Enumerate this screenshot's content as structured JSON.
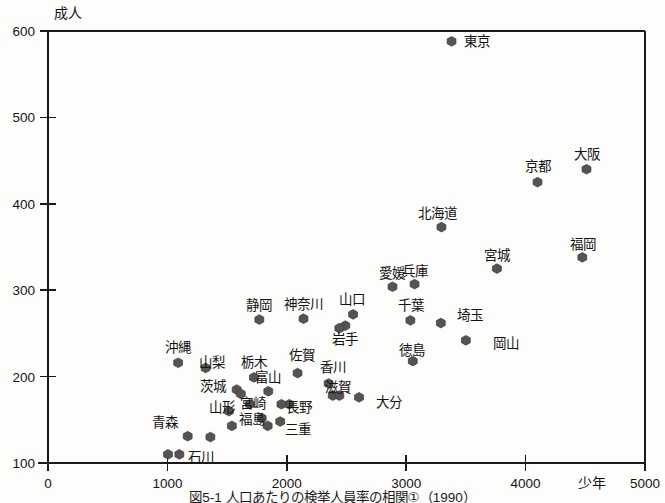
{
  "chart_data": {
    "type": "scatter",
    "title": "",
    "xlabel": "少年",
    "ylabel": "成人",
    "xlim": [
      0,
      5000
    ],
    "ylim": [
      100,
      600
    ],
    "xticks": [
      0,
      1000,
      2000,
      3000,
      4000,
      5000
    ],
    "yticks": [
      100,
      200,
      300,
      400,
      500,
      600
    ],
    "xticklabels": [
      "0",
      "1000",
      "2000",
      "3000",
      "4000",
      "5000"
    ],
    "yticklabels": [
      "100",
      "200",
      "300",
      "400",
      "500",
      "600"
    ],
    "grid": false,
    "legend": "none",
    "marker": "filled-hexagon",
    "marker_color": "#555452",
    "points": [
      {
        "label": "東京",
        "x": 3380,
        "y": 588,
        "lx": 464,
        "ly": 46,
        "anchor": "start"
      },
      {
        "label": "大阪",
        "x": 4510,
        "y": 440,
        "lx": 587,
        "ly": 159,
        "anchor": "middle"
      },
      {
        "label": "京都",
        "x": 4100,
        "y": 425,
        "lx": 538,
        "ly": 171,
        "anchor": "middle"
      },
      {
        "label": "北海道",
        "x": 3295,
        "y": 373,
        "lx": 437,
        "ly": 218,
        "anchor": "middle"
      },
      {
        "label": "福岡",
        "x": 4475,
        "y": 338,
        "lx": 583,
        "ly": 249,
        "anchor": "middle"
      },
      {
        "label": "宮城",
        "x": 3760,
        "y": 325,
        "lx": 497,
        "ly": 260,
        "anchor": "middle"
      },
      {
        "label": "兵庫",
        "x": 3070,
        "y": 307,
        "lx": 415,
        "ly": 276,
        "anchor": "middle"
      },
      {
        "label": "愛媛",
        "x": 2885,
        "y": 304,
        "lx": 392,
        "ly": 278,
        "anchor": "middle"
      },
      {
        "label": "山口",
        "x": 2555,
        "y": 272,
        "lx": 352,
        "ly": 304,
        "anchor": "middle"
      },
      {
        "label": "静岡",
        "x": 1770,
        "y": 266,
        "lx": 259,
        "ly": 310,
        "anchor": "middle"
      },
      {
        "label": "神奈川",
        "x": 2140,
        "y": 267,
        "lx": 303,
        "ly": 309,
        "anchor": "middle"
      },
      {
        "label": "千葉",
        "x": 3035,
        "y": 265,
        "lx": 411,
        "ly": 310,
        "anchor": "middle"
      },
      {
        "label": "埼玉",
        "x": 3290,
        "y": 262,
        "lx": 470,
        "ly": 320,
        "anchor": "middle"
      },
      {
        "label": "岩手",
        "x": 2490,
        "y": 259,
        "lx": 345,
        "ly": 344,
        "anchor": "middle"
      },
      {
        "label": "岡山",
        "x": 3500,
        "y": 242,
        "lx": 493,
        "ly": 348,
        "anchor": "start"
      },
      {
        "label": "徳島",
        "x": 3055,
        "y": 218,
        "lx": 412,
        "ly": 355,
        "anchor": "middle"
      },
      {
        "label": "沖縄",
        "x": 1090,
        "y": 216,
        "lx": 178,
        "ly": 352,
        "anchor": "middle"
      },
      {
        "label": "山梨",
        "x": 1320,
        "y": 210,
        "lx": 212,
        "ly": 367,
        "anchor": "middle"
      },
      {
        "label": "栃木",
        "x": 1725,
        "y": 199,
        "lx": 254,
        "ly": 367,
        "anchor": "middle"
      },
      {
        "label": "佐賀",
        "x": 2090,
        "y": 204,
        "lx": 302,
        "ly": 360,
        "anchor": "middle"
      },
      {
        "label": "香川",
        "x": 2350,
        "y": 192,
        "lx": 333,
        "ly": 372,
        "anchor": "middle"
      },
      {
        "label": "茨城",
        "x": 1580,
        "y": 185,
        "lx": 213,
        "ly": 391,
        "anchor": "middle"
      },
      {
        "label": "富山",
        "x": 1845,
        "y": 183,
        "lx": 268,
        "ly": 382,
        "anchor": "middle"
      },
      {
        "label": "滋賀",
        "x": 2385,
        "y": 178,
        "lx": 338,
        "ly": 392,
        "anchor": "middle"
      },
      {
        "label": "大分",
        "x": 2605,
        "y": 176,
        "lx": 376,
        "ly": 407,
        "anchor": "start"
      },
      {
        "label": "宮崎",
        "x": 1690,
        "y": 168,
        "lx": 253,
        "ly": 408,
        "anchor": "middle"
      },
      {
        "label": "長野",
        "x": 2020,
        "y": 168,
        "lx": 299,
        "ly": 412,
        "anchor": "middle"
      },
      {
        "label": "山形",
        "x": 1515,
        "y": 160,
        "lx": 222,
        "ly": 412,
        "anchor": "middle"
      },
      {
        "label": "福島",
        "x": 1790,
        "y": 152,
        "lx": 252,
        "ly": 424,
        "anchor": "middle"
      },
      {
        "label": "三重",
        "x": 1945,
        "y": 148,
        "lx": 298,
        "ly": 434,
        "anchor": "middle"
      },
      {
        "label": "青森",
        "x": 1170,
        "y": 131,
        "lx": 165,
        "ly": 427,
        "anchor": "middle"
      },
      {
        "label": "石川",
        "x": 1005,
        "y": 110,
        "lx": 201,
        "ly": 462,
        "anchor": "middle"
      }
    ],
    "extra_points": [
      {
        "x": 2440,
        "y": 256
      },
      {
        "x": 1615,
        "y": 180
      },
      {
        "x": 1955,
        "y": 168
      },
      {
        "x": 2440,
        "y": 178
      },
      {
        "x": 1540,
        "y": 143
      },
      {
        "x": 1840,
        "y": 143
      },
      {
        "x": 1360,
        "y": 130
      },
      {
        "x": 1100,
        "y": 110
      }
    ]
  },
  "caption": {
    "text": "図5-1 人口あたりの検挙人員率の相関①（1990）"
  }
}
